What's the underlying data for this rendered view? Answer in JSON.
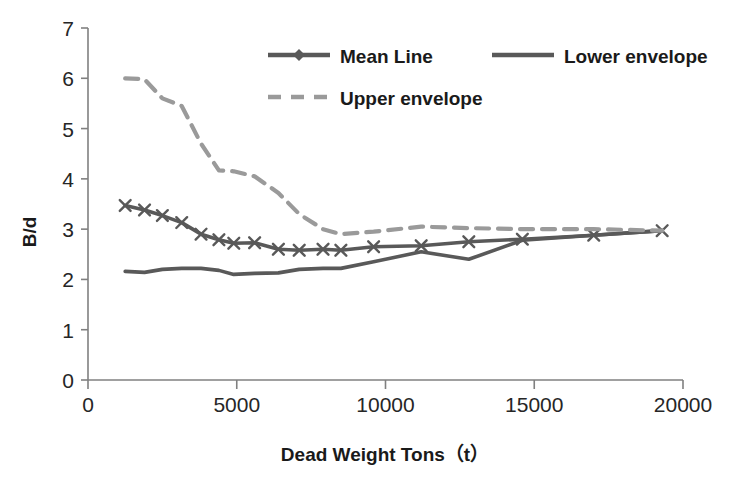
{
  "chart_data": {
    "type": "line",
    "title": "",
    "xlabel": "Dead Weight Tons（t）",
    "ylabel": "B/d",
    "xlim": [
      0,
      20000
    ],
    "ylim": [
      0,
      7
    ],
    "xticks": [
      0,
      5000,
      10000,
      15000,
      20000
    ],
    "yticks": [
      0,
      1,
      2,
      3,
      4,
      5,
      6,
      7
    ],
    "grid": false,
    "legend_position": "top-right",
    "series": [
      {
        "name": "Mean Line",
        "color": "#595959",
        "style": "solid-marker",
        "marker": "x",
        "x": [
          1250,
          1900,
          2500,
          3150,
          3800,
          4400,
          4900,
          5600,
          6400,
          7100,
          7900,
          8500,
          9600,
          11200,
          12800,
          14600,
          17000,
          19300
        ],
        "y": [
          3.47,
          3.38,
          3.27,
          3.13,
          2.9,
          2.79,
          2.72,
          2.73,
          2.6,
          2.58,
          2.6,
          2.58,
          2.65,
          2.67,
          2.75,
          2.8,
          2.88,
          2.97
        ]
      },
      {
        "name": "Lower envelope",
        "color": "#595959",
        "style": "solid",
        "x": [
          1250,
          1900,
          2500,
          3150,
          3800,
          4400,
          4900,
          5600,
          6400,
          7100,
          7900,
          8500,
          9600,
          11200,
          12800,
          14600,
          17000,
          19300
        ],
        "y": [
          2.16,
          2.14,
          2.2,
          2.22,
          2.22,
          2.18,
          2.1,
          2.12,
          2.13,
          2.2,
          2.22,
          2.22,
          2.35,
          2.55,
          2.4,
          2.78,
          2.88,
          2.97
        ]
      },
      {
        "name": "Upper envelope",
        "color": "#9a9a9a",
        "style": "dashed",
        "x": [
          1250,
          1900,
          2500,
          3150,
          3800,
          4400,
          4900,
          5600,
          6400,
          7100,
          7900,
          8500,
          9600,
          11200,
          12800,
          14600,
          17000,
          19300
        ],
        "y": [
          6.0,
          5.98,
          5.6,
          5.45,
          4.7,
          4.17,
          4.15,
          4.05,
          3.72,
          3.3,
          3.0,
          2.9,
          2.95,
          3.05,
          3.02,
          3.0,
          3.0,
          2.97
        ]
      }
    ],
    "legend": [
      {
        "label": "Mean Line",
        "color": "#595959",
        "style": "solid-marker"
      },
      {
        "label": "Lower envelope",
        "color": "#595959",
        "style": "solid"
      },
      {
        "label": "Upper envelope",
        "color": "#9a9a9a",
        "style": "dashed"
      }
    ]
  },
  "axes": {
    "x_tick_labels": [
      "0",
      "5000",
      "10000",
      "15000",
      "20000"
    ],
    "y_tick_labels": [
      "0",
      "1",
      "2",
      "3",
      "4",
      "5",
      "6",
      "7"
    ],
    "x_axis_title": "Dead Weight Tons（t）",
    "y_axis_title": "B/d"
  },
  "legend_items": [
    {
      "label": "Mean Line"
    },
    {
      "label": "Lower envelope"
    },
    {
      "label": "Upper envelope"
    }
  ],
  "colors": {
    "mean_line": "#595959",
    "lower_envelope": "#595959",
    "upper_envelope": "#9a9a9a",
    "axis": "#808080",
    "text": "#262626",
    "background": "#ffffff"
  }
}
